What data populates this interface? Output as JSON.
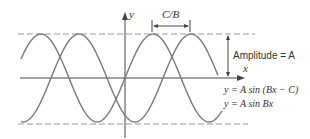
{
  "diagram": {
    "labels": {
      "y_axis": "y",
      "x_axis": "x",
      "shift": "C/B",
      "amplitude": "Amplitude = A",
      "curve_shifted": "y = A sin (Bx − C)",
      "curve_base": "y = A sin Bx"
    },
    "colors": {
      "curve": "#7a7a7a",
      "axis": "#444444",
      "dashed": "#9a9a9a",
      "text": "#333333"
    },
    "geometry": {
      "origin": [
        125,
        78
      ],
      "amplitude_px": 44,
      "period_px": 112,
      "shift_px": 38,
      "x_start": 21,
      "base_curve_end": 222,
      "shifted_curve_end": 218
    }
  }
}
